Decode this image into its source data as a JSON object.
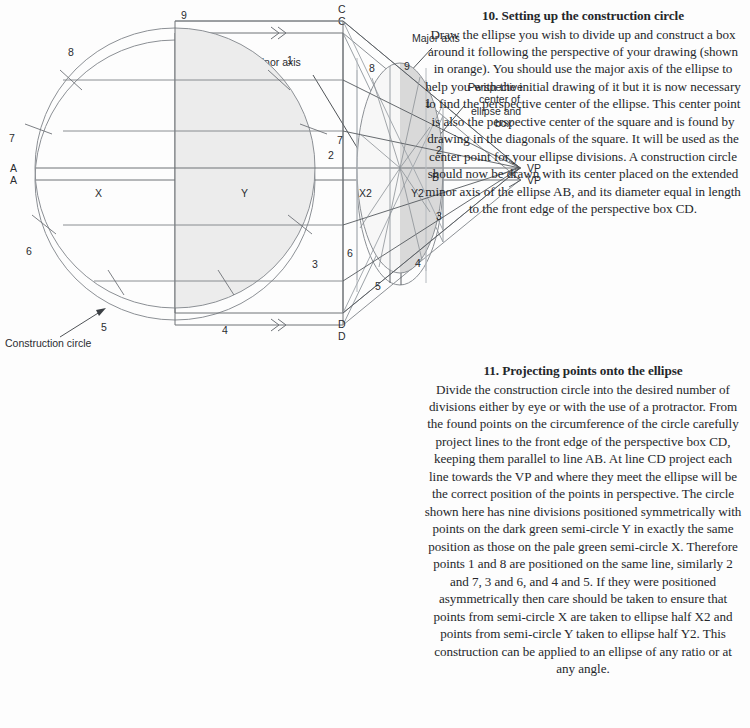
{
  "page": {
    "background": "#fdfdfd",
    "ink": "#6e7277",
    "ink_dark": "#3b3f44",
    "text_color": "#25272b",
    "pale_fill": "#efefef",
    "dark_fill": "#dcdcdc"
  },
  "sections": [
    {
      "id": "section-10",
      "number_title": "10. Setting up the construction circle",
      "body": "Draw the ellipse you wish to divide up and construct a box around it following the perspective of your drawing (shown in orange). You should use the major axis of the ellipse to help you with the initial drawing of it but it is now necessary to  find the perspective center of the ellipse. This center point is also the perspective center of the square and is found by drawing in the diagonals of the square. It will be used as the center point for your ellipse divisions. A construction circle should now be drawn with its center placed on the extended minor axis of the ellipse AB, and its diameter equal in length to the front edge of the perspective box CD."
    },
    {
      "id": "section-11",
      "number_title": "11. Projecting points onto the ellipse",
      "body": "Divide the construction circle into the desired number of divisions either by eye or with the use of a protractor. From the found points on the circumference of the circle carefully project lines to the front edge of the perspective box CD, keeping them parallel to line AB. At line CD project each line towards the VP and where they meet the ellipse will be the correct position of the points in perspective. The circle shown here has nine divisions positioned symmetrically with points on the dark green semi-circle Y in exactly the same position as those on the pale green semi-circle X. Therefore points 1 and 8 are positioned on the same line, similarly 2 and 7, 3 and 6, and 4 and 5. If they were positioned asymmetrically then care should be taken to ensure that points from semi-circle X are taken to ellipse half X2 and points from semi-circle Y taken to ellipse half Y2. This construction can be applied to an ellipse of any ratio or at any angle."
    }
  ],
  "diagram_top": {
    "labels": {
      "A": "A",
      "B": "B",
      "C": "C",
      "D": "D",
      "VP": "VP",
      "minor_axis": "Minor axis",
      "major_axis": "Major axis",
      "perspective_center": "Perspective\ncenter of\nellipse and\nbox",
      "perspective_center_lines": [
        "Perspective",
        "center of",
        "ellipse and",
        "box"
      ],
      "construction_circle": "Construction circle"
    },
    "geometry": {
      "circle_center_x": 175,
      "circle_center_y": 180,
      "circle_radius": 140,
      "box_front_x": 343,
      "box_top_y": 33,
      "box_bottom_y": 325,
      "vp_x": 520,
      "vp_y": 180,
      "ellipse_cx": 400,
      "ellipse_cy": 180,
      "ellipse_rx": 43,
      "ellipse_ry": 105
    }
  },
  "diagram_bottom": {
    "labels": {
      "A": "A",
      "B": "B",
      "C": "C",
      "D": "D",
      "VP": "VP",
      "X": "X",
      "Y": "Y",
      "X2": "X2",
      "Y2": "Y2"
    },
    "circle_point_numbers": [
      "1",
      "2",
      "3",
      "4",
      "5",
      "6",
      "7",
      "8",
      "9"
    ],
    "ellipse_point_numbers": [
      "1",
      "2",
      "3",
      "4",
      "5",
      "6",
      "7",
      "8",
      "9"
    ],
    "divisions": 9,
    "geometry": {
      "circle_center_x": 175,
      "circle_center_y": 528,
      "circle_radius": 140,
      "box_front_x": 343,
      "box_top_y": 381,
      "box_bottom_y": 673,
      "vp_x": 520,
      "vp_y": 528,
      "ellipse_cx": 400,
      "ellipse_cy": 528,
      "ellipse_rx": 43,
      "ellipse_ry": 105
    }
  }
}
